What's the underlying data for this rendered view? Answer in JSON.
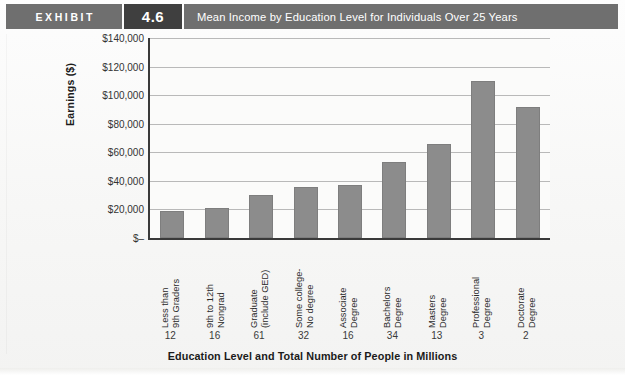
{
  "header": {
    "exhibit_label": "EXHIBIT",
    "exhibit_number": "4.6",
    "title": "Mean Income by Education Level for Individuals Over 25 Years"
  },
  "chart_data": {
    "type": "bar",
    "title": "Mean Income by Education Level for Individuals Over 25 Years",
    "xlabel": "Education Level and Total Number of People in Millions",
    "ylabel": "Earnings ($)",
    "ylim": [
      0,
      140000
    ],
    "grid": true,
    "legend": null,
    "categories": [
      "Less than 9th Graders",
      "9th to 12th Nongrad",
      "Graduate (include GED)",
      "Some college-No degree",
      "Associate Degree",
      "Bachelors Degree",
      "Masters Degree",
      "Professional Degree",
      "Doctorate Degree"
    ],
    "category_lines": [
      [
        "Less than",
        "9th Graders"
      ],
      [
        "9th to 12th",
        "Nongrad"
      ],
      [
        "Graduate",
        "(include GED)"
      ],
      [
        "Some college-",
        "No degree"
      ],
      [
        "Associate",
        "Degree"
      ],
      [
        "Bachelors",
        "Degree"
      ],
      [
        "Masters",
        "Degree"
      ],
      [
        "Professional",
        "Degree"
      ],
      [
        "Doctorate",
        "Degree"
      ]
    ],
    "values": [
      19000,
      21000,
      30000,
      36000,
      37000,
      53000,
      66000,
      110000,
      92000
    ],
    "people_millions": [
      12,
      16,
      61,
      32,
      16,
      34,
      13,
      3,
      2
    ],
    "ytick_labels": [
      "$140,000",
      "$120,000",
      "$100,000",
      "$80,000",
      "$60,000",
      "$40,000",
      "$20,000",
      "$–"
    ],
    "ytick_values": [
      140000,
      120000,
      100000,
      80000,
      60000,
      40000,
      20000,
      0
    ],
    "bar_color": "#8c8c8c",
    "grid_color": "#b9b9b9",
    "axis_color": "#3a3a3a"
  }
}
